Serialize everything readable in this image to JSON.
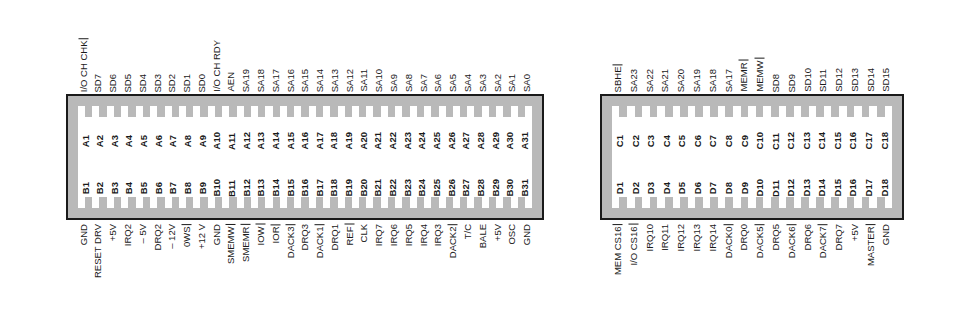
{
  "diagram": {
    "colors": {
      "body": "#b9b9b9",
      "outline": "#1a1a1a",
      "slot": "#ffffff",
      "text": "#1a1a1a"
    }
  },
  "connectors": [
    {
      "id": "left",
      "name": "isa-8bit-section",
      "pin_count": 31,
      "top_row_prefix": "A",
      "bottom_row_prefix": "B",
      "top_pins": [
        "A1",
        "A2",
        "A3",
        "A4",
        "A5",
        "A6",
        "A7",
        "A8",
        "A9",
        "A10",
        "A11",
        "A12",
        "A13",
        "A14",
        "A15",
        "A16",
        "A17",
        "A18",
        "A19",
        "A20",
        "A21",
        "A22",
        "A23",
        "A24",
        "A25",
        "A26",
        "A27",
        "A28",
        "A29",
        "A30",
        "A31"
      ],
      "bottom_pins": [
        "B1",
        "B2",
        "B3",
        "B4",
        "B5",
        "B6",
        "B7",
        "B8",
        "B9",
        "B10",
        "B11",
        "B12",
        "B13",
        "B14",
        "B15",
        "B16",
        "B17",
        "B18",
        "B19",
        "B20",
        "B21",
        "B22",
        "B23",
        "B24",
        "B25",
        "B26",
        "B27",
        "B28",
        "B29",
        "B30",
        "B31"
      ],
      "top_signals": [
        {
          "label": "I/O CH CHK",
          "overline": true
        },
        {
          "label": "SD7",
          "overline": false
        },
        {
          "label": "SD6",
          "overline": false
        },
        {
          "label": "SD5",
          "overline": false
        },
        {
          "label": "SD4",
          "overline": false
        },
        {
          "label": "SD3",
          "overline": false
        },
        {
          "label": "SD2",
          "overline": false
        },
        {
          "label": "SD1",
          "overline": false
        },
        {
          "label": "SD0",
          "overline": false
        },
        {
          "label": "I/O CH RDY",
          "overline": false
        },
        {
          "label": "AEN",
          "overline": false
        },
        {
          "label": "SA19",
          "overline": false
        },
        {
          "label": "SA18",
          "overline": false
        },
        {
          "label": "SA17",
          "overline": false
        },
        {
          "label": "SA16",
          "overline": false
        },
        {
          "label": "SA15",
          "overline": false
        },
        {
          "label": "SA14",
          "overline": false
        },
        {
          "label": "SA13",
          "overline": false
        },
        {
          "label": "SA12",
          "overline": false
        },
        {
          "label": "SA11",
          "overline": false
        },
        {
          "label": "SA10",
          "overline": false
        },
        {
          "label": "SA9",
          "overline": false
        },
        {
          "label": "SA8",
          "overline": false
        },
        {
          "label": "SA7",
          "overline": false
        },
        {
          "label": "SA6",
          "overline": false
        },
        {
          "label": "SA5",
          "overline": false
        },
        {
          "label": "SA4",
          "overline": false
        },
        {
          "label": "SA3",
          "overline": false
        },
        {
          "label": "SA2",
          "overline": false
        },
        {
          "label": "SA1",
          "overline": false
        },
        {
          "label": "SA0",
          "overline": false
        }
      ],
      "bottom_signals": [
        {
          "label": "GND",
          "overline": false
        },
        {
          "label": "RESET DRV",
          "overline": false
        },
        {
          "label": "+5V",
          "overline": false
        },
        {
          "label": "IRQ2",
          "overline": false
        },
        {
          "label": "– 5V",
          "overline": false
        },
        {
          "label": "DRQ2",
          "overline": false
        },
        {
          "label": "– 12V",
          "overline": false
        },
        {
          "label": "0WS",
          "overline": true
        },
        {
          "label": "+12 V",
          "overline": false
        },
        {
          "label": "GND",
          "overline": false
        },
        {
          "label": "SMEMW",
          "overline": true
        },
        {
          "label": "SMEMR",
          "overline": true
        },
        {
          "label": "IOW",
          "overline": true
        },
        {
          "label": "IOR",
          "overline": true
        },
        {
          "label": "DACK3",
          "overline": true
        },
        {
          "label": "DRQ3",
          "overline": false
        },
        {
          "label": "DACK1",
          "overline": true
        },
        {
          "label": "DRQ1",
          "overline": false
        },
        {
          "label": "REF",
          "overline": true
        },
        {
          "label": "CLK",
          "overline": false
        },
        {
          "label": "IRQ7",
          "overline": false
        },
        {
          "label": "IRQ6",
          "overline": false
        },
        {
          "label": "IRQ5",
          "overline": false
        },
        {
          "label": "IRQ4",
          "overline": false
        },
        {
          "label": "IRQ3",
          "overline": false
        },
        {
          "label": "DACK2",
          "overline": true
        },
        {
          "label": "T/C",
          "overline": false
        },
        {
          "label": "BALE",
          "overline": false
        },
        {
          "label": "+5V",
          "overline": false
        },
        {
          "label": "OSC",
          "overline": false
        },
        {
          "label": "GND",
          "overline": false
        }
      ]
    },
    {
      "id": "right",
      "name": "isa-16bit-extension",
      "pin_count": 18,
      "top_row_prefix": "C",
      "bottom_row_prefix": "D",
      "top_pins": [
        "C1",
        "C2",
        "C3",
        "C4",
        "C5",
        "C6",
        "C7",
        "C8",
        "C9",
        "C10",
        "C11",
        "C12",
        "C13",
        "C14",
        "C15",
        "C16",
        "C17",
        "C18"
      ],
      "bottom_pins": [
        "D1",
        "D2",
        "D3",
        "D4",
        "D5",
        "D6",
        "D7",
        "D8",
        "D9",
        "D10",
        "D11",
        "D12",
        "D13",
        "D14",
        "D15",
        "D16",
        "D17",
        "D18"
      ],
      "top_signals": [
        {
          "label": "SBHE",
          "overline": true
        },
        {
          "label": "SA23",
          "overline": false
        },
        {
          "label": "SA22",
          "overline": false
        },
        {
          "label": "SA21",
          "overline": false
        },
        {
          "label": "SA20",
          "overline": false
        },
        {
          "label": "SA19",
          "overline": false
        },
        {
          "label": "SA18",
          "overline": false
        },
        {
          "label": "SA17",
          "overline": false
        },
        {
          "label": "MEMR",
          "overline": true
        },
        {
          "label": "MEMW",
          "overline": true
        },
        {
          "label": "SD8",
          "overline": false
        },
        {
          "label": "SD9",
          "overline": false
        },
        {
          "label": "SD10",
          "overline": false
        },
        {
          "label": "SD11",
          "overline": false
        },
        {
          "label": "SD12",
          "overline": false
        },
        {
          "label": "SD13",
          "overline": false
        },
        {
          "label": "SD14",
          "overline": false
        },
        {
          "label": "SD15",
          "overline": false
        }
      ],
      "bottom_signals": [
        {
          "label": "MEM CS16",
          "overline": true
        },
        {
          "label": "I/O CS16",
          "overline": true
        },
        {
          "label": "IRQ10",
          "overline": false
        },
        {
          "label": "IRQ11",
          "overline": false
        },
        {
          "label": "IRQ12",
          "overline": false
        },
        {
          "label": "IRQ13",
          "overline": false
        },
        {
          "label": "IRQ14",
          "overline": false
        },
        {
          "label": "DACK0",
          "overline": true
        },
        {
          "label": "DRQ0",
          "overline": false
        },
        {
          "label": "DACK5",
          "overline": true
        },
        {
          "label": "DRQ5",
          "overline": false
        },
        {
          "label": "DACK6",
          "overline": true
        },
        {
          "label": "DRQ6",
          "overline": false
        },
        {
          "label": "DACK7",
          "overline": true
        },
        {
          "label": "DRQ7",
          "overline": false
        },
        {
          "label": "+5V",
          "overline": false
        },
        {
          "label": "MASTER",
          "overline": true
        },
        {
          "label": "GND",
          "overline": false
        }
      ]
    }
  ]
}
